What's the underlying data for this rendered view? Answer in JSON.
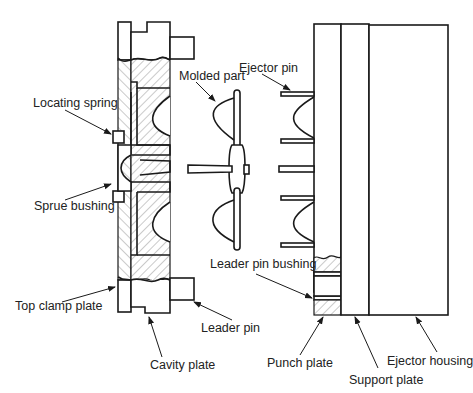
{
  "diagram": {
    "labels": {
      "locating_spring": "Locating spring",
      "sprue_bushing": "Sprue bushing",
      "top_clamp_plate": "Top clamp plate",
      "cavity_plate": "Cavity plate",
      "leader_pin": "Leader pin",
      "molded_part": "Molded part",
      "ejector_pin": "Ejector pin",
      "leader_pin_bushing": "Leader pin bushing",
      "punch_plate": "Punch plate",
      "support_plate": "Support plate",
      "ejector_housing": "Ejector housing"
    },
    "colors": {
      "line": "#1a1a1a",
      "background": "#ffffff",
      "hatch": "#555555"
    }
  }
}
